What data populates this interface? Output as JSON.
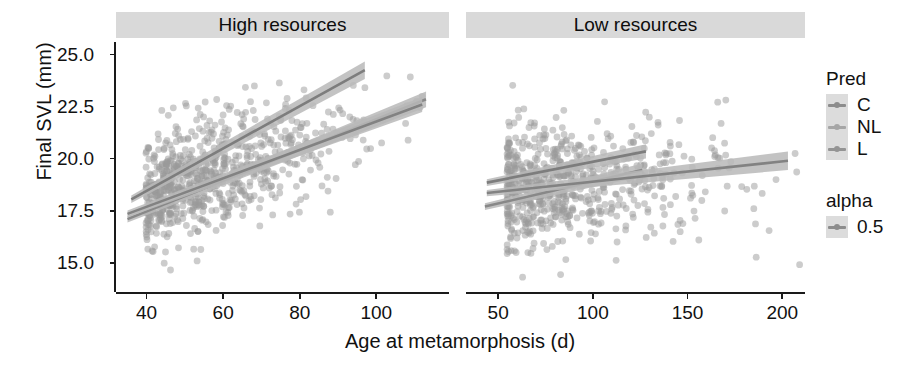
{
  "figure": {
    "axis_titles": {
      "x": "Age at metamorphosis (d)",
      "y": "Final SVL (mm)"
    }
  },
  "legend": {
    "pred": {
      "title": "Pred",
      "items": [
        {
          "label": "C",
          "color": "#8c8c8c"
        },
        {
          "label": "NL",
          "color": "#a6a6a6"
        },
        {
          "label": "L",
          "color": "#949494"
        }
      ]
    },
    "alpha": {
      "title": "alpha",
      "items": [
        {
          "label": "0.5",
          "color": "#8c8c8c"
        }
      ]
    }
  },
  "chart_data": {
    "type": "scatter",
    "title": "",
    "xlabel": "Age at metamorphosis (d)",
    "ylabel": "Final SVL (mm)",
    "grid": false,
    "legend_position": "right",
    "point_color": "#9a9a9a",
    "point_opacity": 0.5,
    "point_radius": 3.4,
    "band_color": "#b8b8b8",
    "line_color": "#6e6e6e",
    "ylim": [
      13.6,
      25.6
    ],
    "yticks": [
      15.0,
      17.5,
      20.0,
      22.5,
      25.0
    ],
    "ytick_labels": [
      "15.0",
      "17.5",
      "20.0",
      "22.5",
      "25.0"
    ],
    "facets": [
      {
        "name": "high-resources",
        "strip_label": "High resources",
        "xlim": [
          32,
          119
        ],
        "xticks": [
          40,
          60,
          80,
          100
        ],
        "xtick_labels": [
          "40",
          "60",
          "80",
          "100"
        ],
        "n_points": 760,
        "cloud": {
          "x_mean": 59,
          "x_sd": 15,
          "x_skew": 1.15,
          "y_intercept": 15.6,
          "y_slope": 0.063,
          "y_sd": 1.35,
          "seed": 20117
        },
        "series": [
          {
            "name": "C",
            "color": "#7d7d7d",
            "x_start": 36,
            "x_end": 97,
            "y_start": 18.05,
            "y_end": 24.25,
            "band_halfwidth_start": 0.18,
            "band_halfwidth_end": 0.42
          },
          {
            "name": "NL",
            "color": "#888888",
            "x_start": 35,
            "x_end": 113,
            "y_start": 17.1,
            "y_end": 22.85,
            "band_halfwidth_start": 0.16,
            "band_halfwidth_end": 0.38
          },
          {
            "name": "L",
            "color": "#828282",
            "x_start": 35,
            "x_end": 112,
            "y_start": 17.35,
            "y_end": 22.6,
            "band_halfwidth_start": 0.16,
            "band_halfwidth_end": 0.36
          }
        ]
      },
      {
        "name": "low-resources",
        "strip_label": "Low resources",
        "xlim": [
          33,
          212
        ],
        "xticks": [
          50,
          100,
          150,
          200
        ],
        "xtick_labels": [
          "50",
          "100",
          "150",
          "200"
        ],
        "n_points": 700,
        "cloud": {
          "x_mean": 92,
          "x_sd": 32,
          "x_skew": 1.35,
          "y_intercept": 18.35,
          "y_slope": 0.0055,
          "y_sd": 1.5,
          "seed": 81733
        },
        "series": [
          {
            "name": "C",
            "color": "#7d7d7d",
            "x_start": 44,
            "x_end": 128,
            "y_start": 18.85,
            "y_end": 20.35,
            "band_halfwidth_start": 0.16,
            "band_halfwidth_end": 0.34
          },
          {
            "name": "NL",
            "color": "#888888",
            "x_start": 43,
            "x_end": 126,
            "y_start": 17.7,
            "y_end": 19.45,
            "band_halfwidth_start": 0.16,
            "band_halfwidth_end": 0.32
          },
          {
            "name": "L",
            "color": "#828282",
            "x_start": 44,
            "x_end": 203,
            "y_start": 18.35,
            "y_end": 19.9,
            "band_halfwidth_start": 0.15,
            "band_halfwidth_end": 0.45
          }
        ]
      }
    ]
  }
}
